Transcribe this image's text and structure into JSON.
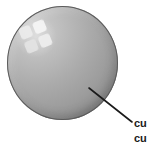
{
  "figure": {
    "name": "sphere-callout-diagram",
    "background_color": "#ffffff",
    "width": 154,
    "height": 146
  },
  "sphere": {
    "name": "gray-sphere",
    "shape": "circle",
    "center_x": 62,
    "center_y": 63,
    "diameter": 111,
    "fill_light": "#d2d2d2",
    "fill_mid": "#a3a3a3",
    "fill_dark": "#7c7c7c",
    "outline_color": "#5b5b5b"
  },
  "highlight": {
    "name": "window-reflection-highlight",
    "panes": 4,
    "color": "#f2f2f2",
    "rotation_degrees": -22
  },
  "leader_line": {
    "name": "callout-leader-line",
    "color": "#1a1a1a",
    "x1": 89,
    "y1": 88,
    "x2": 132,
    "y2": 122,
    "width": 1.6
  },
  "caption": {
    "name": "callout-label",
    "color": "#1a1a1a",
    "lines": [
      "cu",
      "cu"
    ]
  }
}
